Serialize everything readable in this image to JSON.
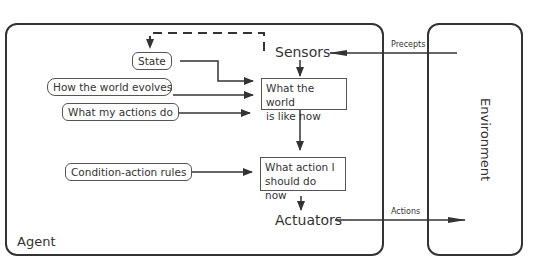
{
  "diagram": {
    "agent": {
      "label": "Agent"
    },
    "environment": {
      "label": "Environment"
    },
    "inputs": {
      "state": "State",
      "world_evolves": "How the world evolves",
      "actions_do": "What my actions do",
      "rules": "Condition-action rules"
    },
    "nodes": {
      "sensors": "Sensors",
      "world_now_line1": "What the world",
      "world_now_line2": "is like now",
      "action_now_line1": "What action I",
      "action_now_line2": "should do now",
      "actuators": "Actuators"
    },
    "edges": {
      "percepts": "Precepts",
      "actions": "Actions"
    },
    "colors": {
      "stroke": "#333333",
      "background": "#ffffff"
    }
  }
}
